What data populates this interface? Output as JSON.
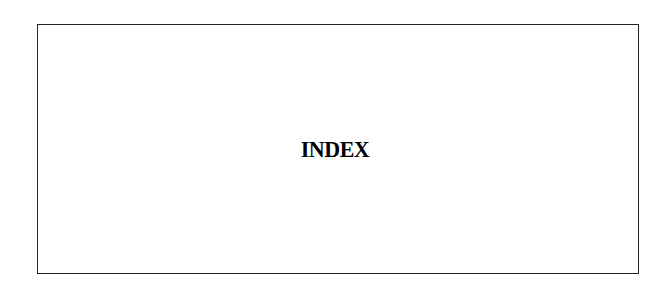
{
  "page": {
    "title": "INDEX"
  },
  "colors": {
    "border": "#222222",
    "text": "#000000",
    "background": "#ffffff"
  }
}
